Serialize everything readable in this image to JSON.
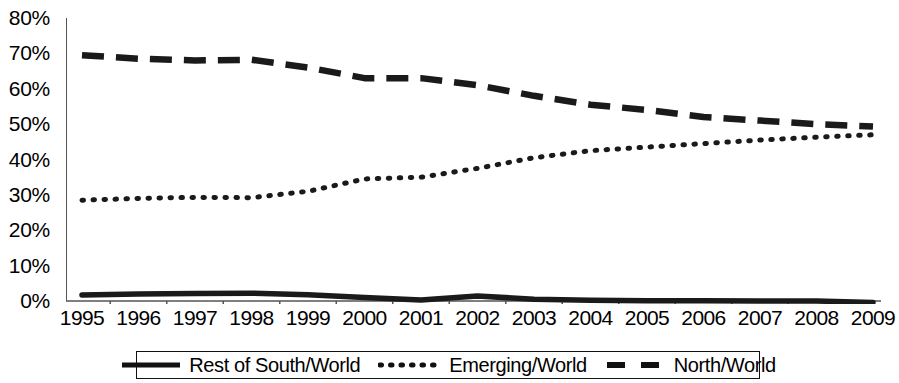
{
  "chart_data": {
    "type": "line",
    "title": "",
    "subtitle": "",
    "xlabel": "",
    "ylabel": "",
    "x": [
      1995,
      1996,
      1997,
      1998,
      1999,
      2000,
      2001,
      2002,
      2003,
      2004,
      2005,
      2006,
      2007,
      2008,
      2009
    ],
    "xtick_labels": [
      "1995",
      "1996",
      "1997",
      "1998",
      "1999",
      "2000",
      "2001",
      "2002",
      "2003",
      "2004",
      "2005",
      "2006",
      "2007",
      "2008",
      "2009"
    ],
    "ytick_labels": [
      "80%",
      "70%",
      "60%",
      "50%",
      "40%",
      "30%",
      "20%",
      "10%",
      "0%"
    ],
    "ytick_values": [
      80,
      70,
      60,
      50,
      40,
      30,
      20,
      10,
      0
    ],
    "ylim": [
      0,
      80
    ],
    "xlim": [
      1995,
      2009
    ],
    "grid": false,
    "legend_position": "bottom",
    "units": "percent",
    "series": [
      {
        "name": "Rest of South/World",
        "style": "solid",
        "color": "#1a1a1a",
        "values": [
          1.7,
          2.0,
          2.1,
          2.2,
          1.8,
          1.0,
          0.3,
          1.4,
          0.5,
          0.2,
          0.1,
          0.1,
          0.0,
          0.0,
          -0.4
        ]
      },
      {
        "name": "Emerging/World",
        "style": "dotted",
        "color": "#1a1a1a",
        "values": [
          28.5,
          29.0,
          29.3,
          29.2,
          31.0,
          34.5,
          35.0,
          37.5,
          40.5,
          42.5,
          43.5,
          44.5,
          45.5,
          46.3,
          47.0
        ]
      },
      {
        "name": "North/World",
        "style": "dashed",
        "color": "#1a1a1a",
        "values": [
          69.5,
          68.5,
          68.0,
          68.2,
          66.0,
          63.0,
          63.0,
          61.0,
          58.0,
          55.5,
          54.0,
          52.0,
          51.0,
          50.0,
          49.3
        ]
      }
    ]
  },
  "legend": {
    "entries": [
      {
        "label": "Rest of South/World",
        "style": "solid"
      },
      {
        "label": "Emerging/World",
        "style": "dotted"
      },
      {
        "label": "North/World",
        "style": "dashed"
      }
    ]
  }
}
